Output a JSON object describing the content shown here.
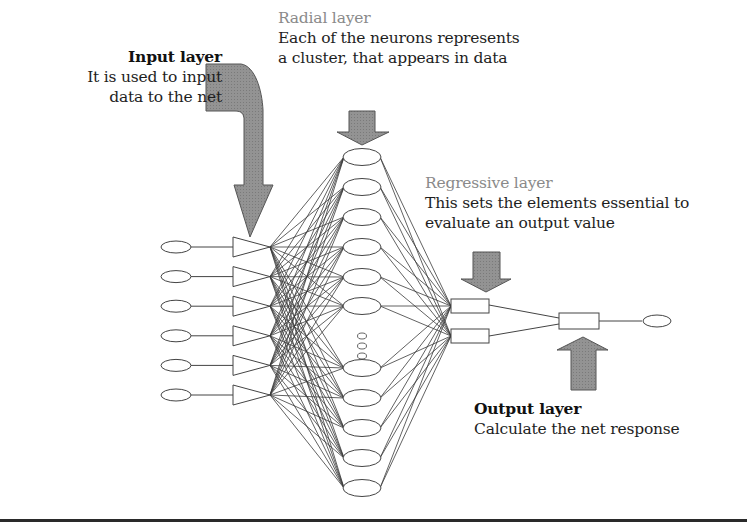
{
  "diagram": {
    "layers": {
      "input": {
        "title": "Input layer",
        "description_lines": [
          "It is used to input",
          "data to the net"
        ],
        "neuron_count": 6
      },
      "radial": {
        "title": "Radial layer",
        "description_lines": [
          "Each of the neurons represents",
          "a cluster, that appears in data"
        ],
        "neuron_count_visible": 11,
        "ellipsis": "⋮"
      },
      "regressive": {
        "title": "Regressive layer",
        "description_lines": [
          "This sets the elements essential to",
          "evaluate an output value"
        ],
        "neuron_count": 2
      },
      "output": {
        "title": "Output layer",
        "description_lines": [
          "Calculate the net response"
        ],
        "neuron_count": 1
      }
    },
    "colors": {
      "arrow_fill": "#8f8f8f",
      "arrow_stroke": "#555555",
      "line": "#444444",
      "title_grey": "#8a8a8a",
      "text": "#1e1e1e"
    }
  }
}
